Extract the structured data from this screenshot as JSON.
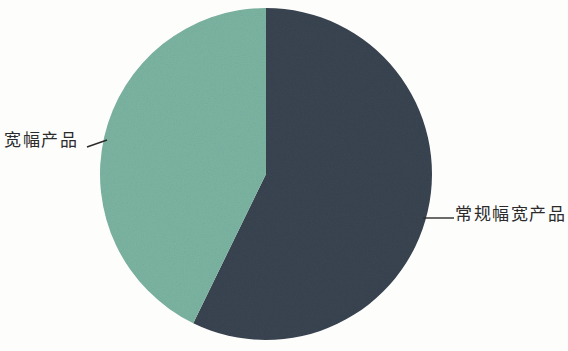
{
  "chart_data": {
    "type": "pie",
    "title": "",
    "subtitle": "",
    "xlabel": "",
    "ylabel": "",
    "legend_position": "none",
    "grid": false,
    "labels_position": "outside-with-leader-lines",
    "categories": [
      "常规幅宽产品",
      "宽幅产品"
    ],
    "values": [
      57,
      43
    ],
    "value_unit": "percent",
    "slices": [
      {
        "name": "常规幅宽产品",
        "value": 57,
        "color": "#3a4552",
        "start_angle_deg": 0,
        "end_angle_deg": 206,
        "label_side": "right"
      },
      {
        "name": "宽幅产品",
        "value": 43,
        "color": "#7cb4a2",
        "start_angle_deg": 206,
        "end_angle_deg": 360,
        "label_side": "left"
      }
    ]
  },
  "labels": {
    "wide_product": "宽幅产品",
    "regular_width_product": "常规幅宽产品"
  },
  "colors": {
    "dark_slice": "#3a4552",
    "green_slice": "#7cb4a2",
    "leader_line": "#2b2b2b",
    "background": "#fdfdfc",
    "text": "#2b2b2b"
  },
  "geometry": {
    "center_x": 266,
    "center_y": 174,
    "radius": 166
  }
}
